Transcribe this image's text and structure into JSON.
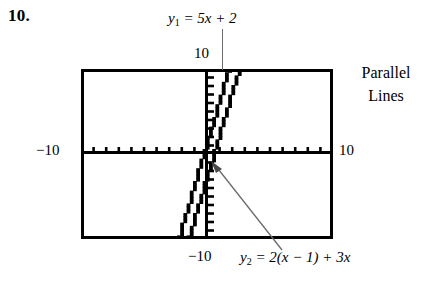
{
  "problem": {
    "number": "10."
  },
  "equations": {
    "y1": {
      "lhs_var": "y",
      "lhs_sub": "1",
      "rhs": "= 5x + 2",
      "full": "y1 = 5x + 2"
    },
    "y2": {
      "lhs_var": "y",
      "lhs_sub": "2",
      "rhs": "= 2(x − 1) + 3x",
      "full": "y2 = 2(x - 1) + 3x"
    }
  },
  "side_note": {
    "line1": "Parallel",
    "line2": "Lines"
  },
  "axis_labels": {
    "y_max": "10",
    "x_min": "−10",
    "x_max": "10",
    "y_min": "−10"
  },
  "colors": {
    "ink": "#000000",
    "leader": "#6b6b6b",
    "window_background": "#ffffff"
  },
  "chart_data": {
    "type": "line",
    "title": "",
    "xlabel": "",
    "ylabel": "",
    "xlim": [
      -10,
      10
    ],
    "ylim": [
      -10,
      10
    ],
    "grid": false,
    "legend": "none",
    "axis_tick_spacing": 1,
    "annotations": [
      {
        "text": "y1 = 5x + 2",
        "target": "line-y1",
        "kind": "leader-line"
      },
      {
        "text": "y2 = 2(x - 1) + 3x",
        "target": "line-y2",
        "kind": "arrow"
      },
      {
        "text": "Parallel Lines",
        "kind": "side-note"
      }
    ],
    "series": [
      {
        "name": "y1 = 5x + 2",
        "expression": "5x + 2",
        "slope": 5,
        "intercept": 2,
        "x": [
          -2.4,
          -1.6,
          -0.4,
          0,
          0.4,
          1.6
        ],
        "y": [
          -10,
          -6,
          0,
          2,
          4,
          10
        ]
      },
      {
        "name": "y2 = 2(x - 1) + 3x",
        "expression": "5x - 2",
        "slope": 5,
        "intercept": -2,
        "x": [
          -1.6,
          -0.8,
          0,
          0.4,
          1.6,
          2.4
        ],
        "y": [
          -10,
          -6,
          -2,
          0,
          6,
          10
        ]
      }
    ]
  }
}
